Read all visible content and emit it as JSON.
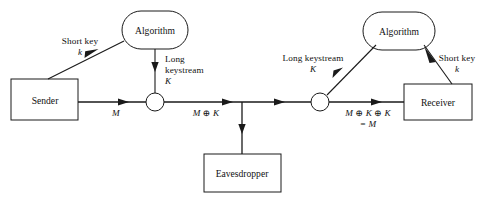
{
  "diagram": {
    "type": "block-flow-diagram",
    "stroke_color": "#1a1a1a",
    "text_color": "#111111",
    "background": "#ffffff",
    "nodes": [
      {
        "id": "algorithm-left",
        "label": "Algorithm",
        "shape": "rounded-ellipse",
        "x": 155,
        "y": 30,
        "w": 66,
        "h": 38
      },
      {
        "id": "algorithm-right",
        "label": "Algorithm",
        "shape": "rounded-ellipse",
        "x": 399,
        "y": 31,
        "w": 72,
        "h": 38
      },
      {
        "id": "sender",
        "label": "Sender",
        "shape": "rectangle",
        "x": 45,
        "y": 100,
        "w": 67,
        "h": 41
      },
      {
        "id": "receiver",
        "label": "Receiver",
        "shape": "rectangle",
        "x": 438,
        "y": 102,
        "w": 68,
        "h": 36
      },
      {
        "id": "eavesdropper",
        "label": "Eavesdropper",
        "shape": "rectangle",
        "x": 242,
        "y": 173,
        "w": 77,
        "h": 38
      },
      {
        "id": "xor-left",
        "label": "",
        "shape": "circle",
        "x": 155,
        "y": 102,
        "r": 9
      },
      {
        "id": "xor-right",
        "label": "",
        "shape": "circle",
        "x": 320,
        "y": 102,
        "r": 9
      }
    ],
    "labels": {
      "short_key_left": {
        "line1": "Short key",
        "line2": "k"
      },
      "long_keystream_left": {
        "line1": "Long",
        "line2": "keystream",
        "line3": "K"
      },
      "long_keystream_right": {
        "line1": "Long keystream",
        "line2": "K"
      },
      "short_key_right": {
        "line1": "Short key",
        "line2": "k"
      },
      "plaintext_in": "M",
      "ciphertext": "M ⊕ K",
      "decrypted_line1": "M ⊕ K ⊕ K",
      "decrypted_line2": "= M"
    }
  }
}
